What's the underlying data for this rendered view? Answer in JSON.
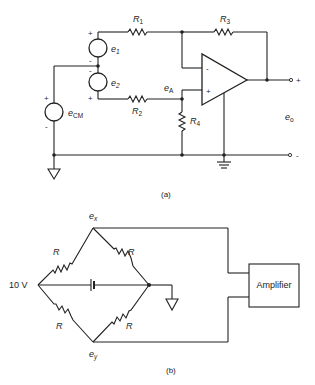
{
  "figure_a": {
    "caption": "(a)",
    "sources": {
      "e1": {
        "label": "e",
        "sub": "1",
        "plus": "+",
        "minus": "-"
      },
      "e2": {
        "label": "e",
        "sub": "2",
        "plus": "+",
        "minus": "-"
      },
      "ecm": {
        "label": "e",
        "sub": "CM",
        "plus": "+",
        "minus": "-"
      }
    },
    "resistors": {
      "r1": {
        "label": "R",
        "sub": "1"
      },
      "r2": {
        "label": "R",
        "sub": "2"
      },
      "r3": {
        "label": "R",
        "sub": "3"
      },
      "r4": {
        "label": "R",
        "sub": "4"
      }
    },
    "node_labels": {
      "ea": {
        "label": "e",
        "sub": "A"
      },
      "eo": {
        "label": "e",
        "sub": "o"
      }
    },
    "opamp": {
      "inverting": "-",
      "noninverting": "+"
    },
    "output_terminals": {
      "plus": "+",
      "minus": "-"
    }
  },
  "figure_b": {
    "caption": "(b)",
    "supply_label": "10 V",
    "resistors": [
      "R",
      "R",
      "R",
      "R"
    ],
    "node_labels": {
      "ex": {
        "label": "e",
        "sub": "x"
      },
      "ey": {
        "label": "e",
        "sub": "y"
      }
    },
    "amplifier_label": "Amplifier"
  }
}
